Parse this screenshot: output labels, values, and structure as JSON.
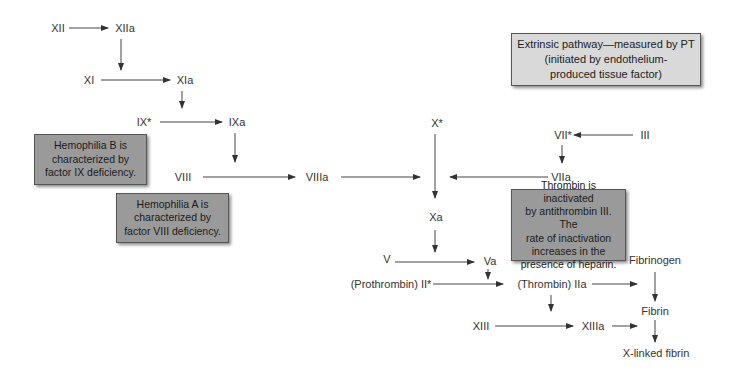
{
  "diagram": {
    "factors": {
      "xii": "XII",
      "xiia": "XIIa",
      "xi": "XI",
      "xia": "XIa",
      "ix": "IX*",
      "ixa": "IXa",
      "viii": "VIII",
      "viiia": "VIIIa",
      "x": "X*",
      "vii": "VII*",
      "iii": "III",
      "viia": "VIIa",
      "xa": "Xa",
      "v": "V",
      "va": "Va",
      "prothrombin": "(Prothrombin) II*",
      "thrombin": "(Thrombin) IIa",
      "xiii": "XIII",
      "xiiia": "XIIIa",
      "fibrinogen": "Fibrinogen",
      "fibrin": "Fibrin",
      "xlinked_fibrin": "X-linked fibrin"
    },
    "notes": {
      "hemophilia_b": [
        "Hemophilia B is",
        "characterized by",
        "factor IX deficiency."
      ],
      "hemophilia_a": [
        "Hemophilia A is",
        "characterized by",
        "factor VIII deficiency."
      ],
      "extrinsic": [
        "Extrinsic pathway—measured by PT",
        "(initiated by endothelium-",
        "produced tissue factor)"
      ],
      "thrombin_inactivation": [
        "Thrombin is inactivated",
        "by antithrombin III. The",
        "rate of inactivation",
        "increases in the",
        "presence of heparin."
      ]
    },
    "colors": {
      "dark_box": "#9a9a9a",
      "light_box": "#d9d9d9",
      "arrow": "#333333",
      "text": "#333333"
    }
  }
}
